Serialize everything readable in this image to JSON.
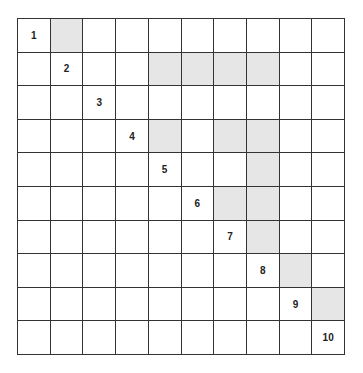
{
  "grid": {
    "rows": 10,
    "cols": 10,
    "shade_color": "#e6e6e6",
    "diagonal_labels": [
      "1",
      "2",
      "3",
      "4",
      "5",
      "6",
      "7",
      "8",
      "9",
      "10"
    ],
    "shaded_cells": [
      [
        0,
        1
      ],
      [
        1,
        4
      ],
      [
        1,
        5
      ],
      [
        1,
        6
      ],
      [
        1,
        7
      ],
      [
        3,
        4
      ],
      [
        3,
        6
      ],
      [
        3,
        7
      ],
      [
        4,
        7
      ],
      [
        5,
        6
      ],
      [
        5,
        7
      ],
      [
        6,
        7
      ],
      [
        7,
        8
      ],
      [
        8,
        9
      ]
    ]
  }
}
